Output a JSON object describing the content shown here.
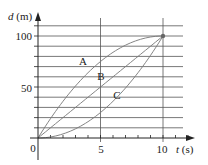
{
  "chart_data": {
    "type": "line",
    "title": "",
    "xlabel": "t (s)",
    "ylabel": "d (m)",
    "xlabel_var": "t",
    "xlabel_unit": "(s)",
    "ylabel_var": "d",
    "ylabel_unit": "(m)",
    "xlim": [
      0,
      10
    ],
    "ylim": [
      0,
      110
    ],
    "x_ticks": [
      0,
      5,
      10
    ],
    "x_tick_labels": [
      "0",
      "5",
      "10"
    ],
    "x_minor_step": 1,
    "y_ticks": [
      50,
      100
    ],
    "y_tick_labels": [
      "50",
      "100"
    ],
    "y_grid_step": 10,
    "grid": {
      "horizontal": true,
      "vertical_at": [
        5,
        10
      ]
    },
    "legend": null,
    "annotations": [
      {
        "text": "A",
        "x": 3.6,
        "y": 76
      },
      {
        "text": "B",
        "x": 5,
        "y": 61
      },
      {
        "text": "C",
        "x": 6.3,
        "y": 42
      },
      {
        "text": "endpoint",
        "x": 10,
        "y": 100,
        "marker": "dot"
      }
    ],
    "x": [
      0,
      1,
      2,
      3,
      4,
      5,
      6,
      7,
      8,
      9,
      10
    ],
    "series": [
      {
        "name": "A",
        "values": [
          0,
          19,
          36,
          51,
          64,
          75,
          84,
          91,
          96,
          99,
          100
        ]
      },
      {
        "name": "B",
        "values": [
          0,
          10,
          20,
          30,
          40,
          50,
          60,
          70,
          80,
          90,
          100
        ]
      },
      {
        "name": "C",
        "values": [
          0,
          1,
          4,
          9,
          16,
          25,
          36,
          49,
          64,
          81,
          100
        ]
      }
    ],
    "colors": {
      "axis": "#222222",
      "grid": "#555555",
      "curve": "#777777",
      "marker": "#666666"
    }
  },
  "labels": {
    "origin": "0",
    "x5": "5",
    "x10": "10",
    "y50": "50",
    "y100": "100",
    "t_var": "t",
    "t_unit": "(s)",
    "d_var": "d",
    "d_unit": "(m)",
    "curve_a": "A",
    "curve_b": "B",
    "curve_c": "C"
  }
}
